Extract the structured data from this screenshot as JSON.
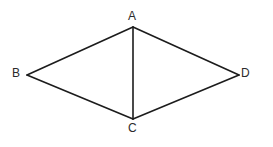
{
  "figure": {
    "kind": "geometry-diagram",
    "shape_name": "quadrilateral-with-diagonal",
    "background_color": "#ffffff",
    "stroke_color": "#1c1c1c",
    "label_color": "#2b2b2b",
    "stroke_width": 1.6,
    "canvas": {
      "width": 273,
      "height": 147
    },
    "vertices": [
      {
        "id": "A",
        "label": "A",
        "x": 133,
        "y": 27,
        "label_x": 128,
        "label_y": 10,
        "position": "top"
      },
      {
        "id": "B",
        "label": "B",
        "x": 27,
        "y": 75,
        "label_x": 12,
        "label_y": 67,
        "position": "left"
      },
      {
        "id": "C",
        "label": "C",
        "x": 133,
        "y": 119,
        "label_x": 128,
        "label_y": 122,
        "position": "bottom"
      },
      {
        "id": "D",
        "label": "D",
        "x": 239,
        "y": 75,
        "label_x": 241,
        "label_y": 67,
        "position": "right"
      }
    ],
    "edges": [
      {
        "id": "AB",
        "from": "A",
        "to": "B",
        "x1": 133,
        "y1": 27,
        "x2": 27,
        "y2": 75,
        "role": "side"
      },
      {
        "id": "BC",
        "from": "B",
        "to": "C",
        "x1": 27,
        "y1": 75,
        "x2": 133,
        "y2": 119,
        "role": "side"
      },
      {
        "id": "CD",
        "from": "C",
        "to": "D",
        "x1": 133,
        "y1": 119,
        "x2": 239,
        "y2": 75,
        "role": "side"
      },
      {
        "id": "DA",
        "from": "D",
        "to": "A",
        "x1": 239,
        "y1": 75,
        "x2": 133,
        "y2": 27,
        "role": "side"
      },
      {
        "id": "AC",
        "from": "A",
        "to": "C",
        "x1": 133,
        "y1": 27,
        "x2": 133,
        "y2": 119,
        "role": "diagonal"
      }
    ]
  }
}
